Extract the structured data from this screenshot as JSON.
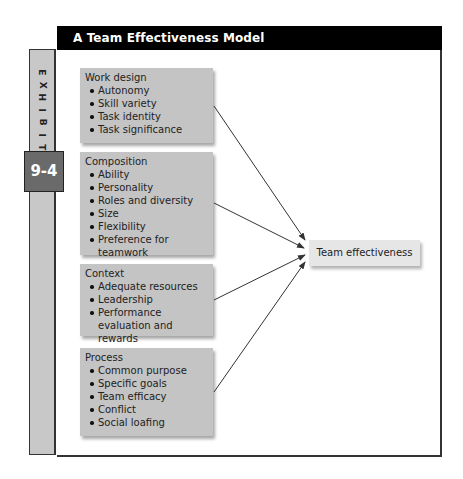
{
  "exhibit": {
    "label_letters": [
      "E",
      "X",
      "H",
      "I",
      "B",
      "I",
      "T"
    ],
    "number": "9-4"
  },
  "header": {
    "title": "A Team Effectiveness Model"
  },
  "factors": [
    {
      "title": "Work design",
      "items": [
        "Autonomy",
        "Skill variety",
        "Task identity",
        "Task significance"
      ]
    },
    {
      "title": "Composition",
      "items": [
        "Ability",
        "Personality",
        "Roles and diversity",
        "Size",
        "Flexibility",
        "Preference for teamwork"
      ]
    },
    {
      "title": "Context",
      "items": [
        "Adequate resources",
        "Leadership",
        "Performance evaluation and rewards"
      ]
    },
    {
      "title": "Process",
      "items": [
        "Common purpose",
        "Specific goals",
        "Team efficacy",
        "Conflict",
        "Social loafing"
      ]
    }
  ],
  "outcome": {
    "label": "Team effectiveness"
  },
  "colors": {
    "header_bg": "#000000",
    "sidebar_bg": "#c8c8c8",
    "badge_bg": "#6a6a6a",
    "factor_box_bg": "#c4c4c4",
    "outcome_box_bg": "#e6e6e6",
    "arrow": "#333333"
  }
}
